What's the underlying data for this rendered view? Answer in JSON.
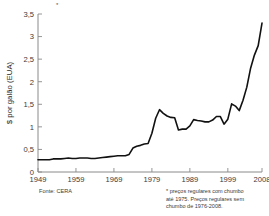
{
  "chart_data": {
    "type": "line",
    "title": "",
    "xlabel": "",
    "ylabel": "$ por galão (EUA)",
    "xlim": [
      1949,
      2008
    ],
    "ylim": [
      0,
      3.5
    ],
    "grid": false,
    "legend_position": "none",
    "xticks": [
      "1949",
      "1959",
      "1969",
      "1979",
      "1989",
      "1999",
      "2008"
    ],
    "xtick_values": [
      1949,
      1959,
      1969,
      1979,
      1989,
      1999,
      2008
    ],
    "yticks": [
      "0",
      "0,5",
      "1",
      "1,5",
      "2",
      "2,5",
      "3",
      "3,5"
    ],
    "ytick_values": [
      0,
      0.5,
      1,
      1.5,
      2,
      2.5,
      3,
      3.5
    ],
    "series": [
      {
        "name": "Preço da gasolina",
        "color": "#111111",
        "x": [
          1949,
          1950,
          1951,
          1952,
          1953,
          1954,
          1955,
          1956,
          1957,
          1958,
          1959,
          1960,
          1961,
          1962,
          1963,
          1964,
          1965,
          1966,
          1967,
          1968,
          1969,
          1970,
          1971,
          1972,
          1973,
          1974,
          1975,
          1976,
          1977,
          1978,
          1979,
          1980,
          1981,
          1982,
          1983,
          1984,
          1985,
          1986,
          1987,
          1988,
          1989,
          1990,
          1991,
          1992,
          1993,
          1994,
          1995,
          1996,
          1997,
          1998,
          1999,
          2000,
          2001,
          2002,
          2003,
          2004,
          2005,
          2006,
          2007,
          2008
        ],
        "values": [
          0.27,
          0.27,
          0.27,
          0.27,
          0.29,
          0.29,
          0.29,
          0.3,
          0.31,
          0.3,
          0.3,
          0.31,
          0.31,
          0.31,
          0.3,
          0.3,
          0.31,
          0.32,
          0.33,
          0.34,
          0.35,
          0.36,
          0.36,
          0.36,
          0.39,
          0.53,
          0.57,
          0.59,
          0.62,
          0.63,
          0.86,
          1.19,
          1.38,
          1.3,
          1.24,
          1.21,
          1.2,
          0.93,
          0.95,
          0.95,
          1.02,
          1.16,
          1.14,
          1.13,
          1.11,
          1.11,
          1.15,
          1.23,
          1.23,
          1.06,
          1.17,
          1.51,
          1.46,
          1.36,
          1.59,
          1.88,
          2.3,
          2.59,
          2.8,
          3.3
        ],
        "linewidth": 1.6
      }
    ],
    "annotations": {
      "asterisk_mark": "*",
      "footnote": "* preços regulares com chumbo até 1975. Preços regulares sem chumbo de 1976-2008.",
      "footnote_lines": [
        "* preços regulares com chumbo",
        "até 1975. Preços regulares sem",
        "chumbo de 1976-2008."
      ],
      "source": "Fonte: CERA"
    },
    "colors": {
      "line": "#111111",
      "axis": "#8a8a8a",
      "text": "#2a2a2a",
      "background": "#ffffff"
    }
  }
}
